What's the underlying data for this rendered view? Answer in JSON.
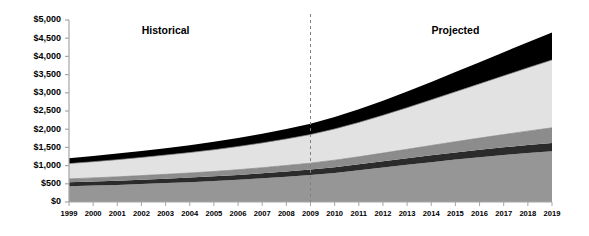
{
  "chart_data": {
    "type": "area",
    "stacked": true,
    "title": "",
    "subtitle": "",
    "xlabel": "",
    "ylabel": "",
    "grid": false,
    "legend_position": "none",
    "xlim": [
      1999,
      2019
    ],
    "ylim": [
      0,
      5000
    ],
    "ytick_step": 500,
    "categories": [
      1999,
      2000,
      2001,
      2002,
      2003,
      2004,
      2005,
      2006,
      2007,
      2008,
      2009,
      2010,
      2011,
      2012,
      2013,
      2014,
      2015,
      2016,
      2017,
      2018,
      2019
    ],
    "x": [
      "1999",
      "2000",
      "2001",
      "2002",
      "2003",
      "2004",
      "2005",
      "2006",
      "2007",
      "2008",
      "2009",
      "2010",
      "2011",
      "2012",
      "2013",
      "2014",
      "2015",
      "2016",
      "2017",
      "2018",
      "2019"
    ],
    "ytick_labels": [
      "$0",
      "$500",
      "$1,000",
      "$1,500",
      "$2,000",
      "$2,500",
      "$3,000",
      "$3,500",
      "$4,000",
      "$4,500",
      "$5,000"
    ],
    "ytick_values": [
      0,
      500,
      1000,
      1500,
      2000,
      2500,
      3000,
      3500,
      4000,
      4500,
      5000
    ],
    "series": [
      {
        "name": "series-1",
        "color": "#969696",
        "values": [
          430,
          450,
          470,
          495,
          520,
          545,
          575,
          610,
          650,
          695,
          740,
          800,
          870,
          945,
          1020,
          1095,
          1165,
          1230,
          1290,
          1345,
          1395
        ]
      },
      {
        "name": "series-2",
        "color": "#2b2b2b",
        "values": [
          110,
          112,
          115,
          118,
          122,
          126,
          130,
          135,
          140,
          146,
          152,
          158,
          165,
          172,
          180,
          188,
          196,
          204,
          212,
          220,
          228
        ]
      },
      {
        "name": "series-3",
        "color": "#8c8c8c",
        "values": [
          95,
          100,
          106,
          112,
          118,
          125,
          133,
          142,
          152,
          163,
          175,
          190,
          207,
          226,
          247,
          270,
          295,
          322,
          351,
          382,
          415
        ]
      },
      {
        "name": "series-4",
        "color": "#e2e2e2",
        "values": [
          420,
          445,
          472,
          500,
          530,
          562,
          598,
          638,
          682,
          730,
          785,
          860,
          945,
          1040,
          1145,
          1255,
          1370,
          1490,
          1615,
          1740,
          1865
        ]
      },
      {
        "name": "series-5",
        "color": "#000000",
        "values": [
          145,
          155,
          166,
          178,
          190,
          204,
          219,
          236,
          254,
          274,
          296,
          325,
          360,
          400,
          444,
          492,
          542,
          594,
          648,
          702,
          757
        ]
      }
    ],
    "totals": [
      1200,
      1262,
      1329,
      1403,
      1480,
      1562,
      1655,
      1761,
      1878,
      2008,
      2148,
      2333,
      2547,
      2783,
      3036,
      3300,
      3568,
      3840,
      4116,
      4389,
      4660
    ],
    "annotations": [
      {
        "name": "historical-label",
        "text": "Historical",
        "x_value": 2003.0,
        "y_value": 4700
      },
      {
        "name": "projected-label",
        "text": "Projected",
        "x_value": 2015.0,
        "y_value": 4700
      }
    ],
    "divider": {
      "name": "historical-projected-divider",
      "x_value": 2009,
      "style": "dashed",
      "color": "#808080"
    },
    "axis_color": "#a6a6a6",
    "inner_line_color": "#808080"
  }
}
